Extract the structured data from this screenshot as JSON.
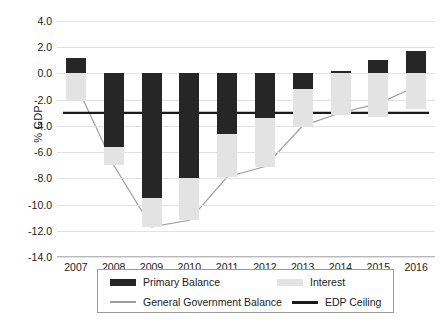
{
  "chart": {
    "type": "bar",
    "title": "",
    "ylabel": "% GDP",
    "xlabel": ""
  },
  "chart_data": {
    "type": "bar",
    "title": "",
    "xlabel": "",
    "ylabel": "% GDP",
    "ylim": [
      -14.0,
      4.0
    ],
    "ytick_values": [
      4.0,
      2.0,
      0.0,
      -2.0,
      -4.0,
      -6.0,
      -8.0,
      -10.0,
      -12.0,
      -14.0
    ],
    "ytick_labels": [
      "4.0",
      "2.0",
      "0.0",
      "-2.0",
      "-4.0",
      "-6.0",
      "-8.0",
      "-10.0",
      "-12.0",
      "-14.0"
    ],
    "grid": true,
    "legend_position": "bottom",
    "categories": [
      "2007",
      "2008",
      "2009",
      "2010",
      "2011",
      "2012",
      "2013",
      "2014",
      "2015",
      "2016"
    ],
    "series": [
      {
        "name": "Primary Balance",
        "kind": "bar",
        "color": "#262626",
        "values": [
          1.2,
          -5.6,
          -9.5,
          -8.0,
          -4.6,
          -3.4,
          -1.2,
          0.2,
          1.0,
          1.7
        ]
      },
      {
        "name": "Interest",
        "kind": "bar",
        "color": "#e3e3e3",
        "values": [
          -2.0,
          -1.4,
          -2.2,
          -3.2,
          -3.3,
          -3.7,
          -2.8,
          -3.2,
          -3.3,
          -2.7
        ]
      },
      {
        "name": "General Government Balance",
        "kind": "line",
        "color": "#9d9d9d",
        "values": [
          -0.8,
          -7.0,
          -11.7,
          -11.2,
          -7.9,
          -7.1,
          -4.0,
          -3.0,
          -2.3,
          -1.0
        ]
      },
      {
        "name": "EDP Ceiling",
        "kind": "line",
        "color": "#1a1a1a",
        "values": [
          -3.0,
          -3.0,
          -3.0,
          -3.0,
          -3.0,
          -3.0,
          -3.0,
          -3.0,
          -3.0,
          -3.0
        ]
      }
    ]
  },
  "legend": {
    "items": [
      {
        "label": "Primary Balance",
        "swatch": "primary-bar-swatch"
      },
      {
        "label": "Interest",
        "swatch": "interest-bar-swatch"
      },
      {
        "label": "General Government Balance",
        "swatch": "ggb-line-swatch"
      },
      {
        "label": "EDP Ceiling",
        "swatch": "edp-line-swatch"
      }
    ]
  }
}
